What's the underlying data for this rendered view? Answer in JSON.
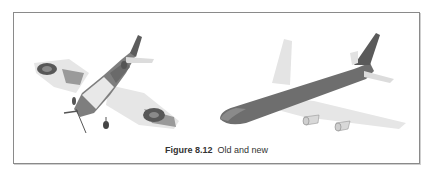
{
  "figure": {
    "label": "Figure 8.12",
    "title": "Old and new",
    "illustrations": [
      {
        "name": "spitfire",
        "description": "WWII fighter aircraft with roundels, camouflage pattern"
      },
      {
        "name": "jumbo-jet",
        "description": "Modern four-engine passenger airliner, grey fuselage"
      }
    ],
    "colors": {
      "border": "#8a8a8a",
      "fuselage": "#6e6e6e",
      "wing": "#e2e2e2",
      "roundel": "#555555",
      "camouflage": "#8c8c8c"
    }
  }
}
